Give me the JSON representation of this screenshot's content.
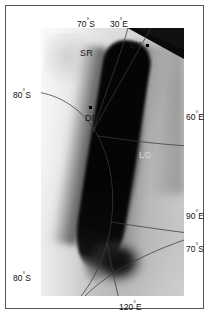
{
  "figure": {
    "kind": "polar-projection-satellite-map",
    "region": "East Antarctica",
    "frame_color": "#555555",
    "background_color": "#ffffff"
  },
  "map": {
    "projection": "polar-stereographic",
    "graticule": {
      "color": "#3b3b3b",
      "latitude_circles": [
        "70°S",
        "80°S"
      ],
      "longitude_lines": [
        "30°E",
        "60°E",
        "90°E",
        "120°E"
      ]
    },
    "dark_feature": {
      "description": "elongated dark low-albedo band",
      "color": "#060606"
    },
    "off_disk_corner_color": "#0a0a0a"
  },
  "coordinate_labels": [
    {
      "id": "lat-70s-top",
      "text": "70",
      "unit": "°",
      "hemi": "S",
      "position": "top"
    },
    {
      "id": "lon-30e-top",
      "text": "30",
      "unit": "°",
      "hemi": "E",
      "position": "top"
    },
    {
      "id": "lat-80s-left-upper",
      "text": "80",
      "unit": "°",
      "hemi": "S",
      "position": "left"
    },
    {
      "id": "lat-80s-left-lower",
      "text": "80",
      "unit": "°",
      "hemi": "S",
      "position": "left"
    },
    {
      "id": "lon-60e-right",
      "text": "60",
      "unit": "°",
      "hemi": "E",
      "position": "right"
    },
    {
      "id": "lon-90e-right",
      "text": "90",
      "unit": "°",
      "hemi": "E",
      "position": "right"
    },
    {
      "id": "lat-70s-right",
      "text": "70",
      "unit": "°",
      "hemi": "S",
      "position": "right"
    },
    {
      "id": "lon-120e-bottom",
      "text": "120",
      "unit": "°",
      "hemi": "E",
      "position": "bottom"
    }
  ],
  "station_labels": [
    {
      "id": "sr",
      "text": "SR",
      "has_marker": false,
      "style": "dark"
    },
    {
      "id": "sy",
      "text": "SY",
      "has_marker": true,
      "style": "dark"
    },
    {
      "id": "df",
      "text": "DF",
      "has_marker": true,
      "style": "dark"
    },
    {
      "id": "lg",
      "text": "LG",
      "has_marker": false,
      "style": "light"
    }
  ]
}
